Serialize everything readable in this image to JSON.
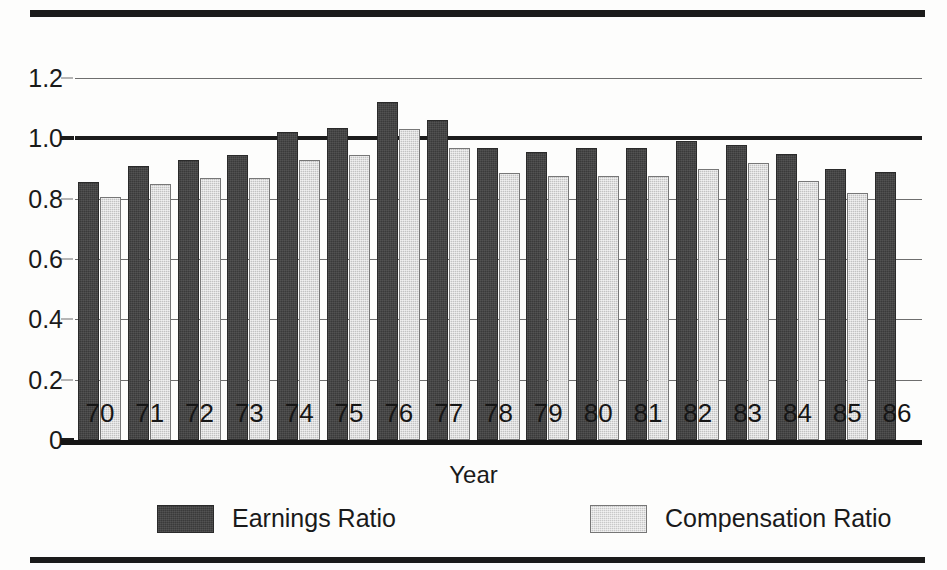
{
  "chart_data": {
    "type": "bar",
    "title": "",
    "xlabel": "Year",
    "ylabel": "",
    "ylim": [
      0,
      1.3
    ],
    "yticks": [
      0,
      0.2,
      0.4,
      0.6,
      0.8,
      1.0,
      1.2
    ],
    "ytick_labels": [
      "0",
      "0.2",
      "0.4",
      "0.6",
      "0.8",
      "1.0",
      "1.2"
    ],
    "grid": true,
    "legend_position": "below-axis",
    "categories": [
      "70",
      "71",
      "72",
      "73",
      "74",
      "75",
      "76",
      "77",
      "78",
      "79",
      "80",
      "81",
      "82",
      "83",
      "84",
      "85",
      "86"
    ],
    "series": [
      {
        "name": "Earnings Ratio",
        "color": "#3a3a3a",
        "values": [
          0.855,
          0.91,
          0.93,
          0.945,
          1.02,
          1.035,
          1.12,
          1.06,
          0.97,
          0.955,
          0.97,
          0.97,
          0.99,
          0.98,
          0.95,
          0.9,
          0.89
        ]
      },
      {
        "name": "Compensation Ratio",
        "color": "#c2c2c2",
        "values": [
          0.805,
          0.85,
          0.87,
          0.87,
          0.93,
          0.945,
          1.03,
          0.97,
          0.885,
          0.875,
          0.875,
          0.875,
          0.9,
          0.92,
          0.86,
          0.82,
          null
        ]
      }
    ],
    "annotations": {
      "emphasized_gridline": 1.0,
      "note": "Year 86 has no Compensation Ratio bar"
    }
  },
  "legend": {
    "items": [
      {
        "label": "Earnings Ratio",
        "swatch": "dark-swatch"
      },
      {
        "label": "Compensation Ratio",
        "swatch": "light-swatch"
      }
    ]
  },
  "axis": {
    "x_title": "Year"
  }
}
